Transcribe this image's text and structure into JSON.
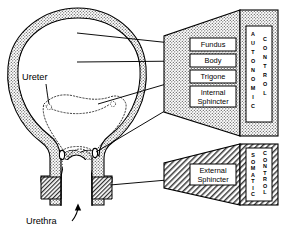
{
  "figure": {
    "organ_labels": [
      {
        "id": "ureter",
        "text": "Ureter"
      },
      {
        "id": "urethra",
        "text": "Urethra"
      }
    ],
    "autonomic_group": {
      "control_words": [
        "AUTONOMIC",
        "CONTROL"
      ],
      "parts": [
        {
          "id": "fundus",
          "lines": [
            "Fundus"
          ]
        },
        {
          "id": "body",
          "lines": [
            "Body"
          ]
        },
        {
          "id": "trigone",
          "lines": [
            "Trigone"
          ]
        },
        {
          "id": "internal-sphincter",
          "lines": [
            "Internal",
            "Sphincter"
          ]
        }
      ]
    },
    "somatic_group": {
      "control_words": [
        "SOMATIC",
        "CONTROL"
      ],
      "parts": [
        {
          "id": "external-sphincter",
          "lines": [
            "External",
            "Sphincter"
          ]
        }
      ]
    },
    "colors": {
      "ink": "#000000",
      "paper": "#ffffff",
      "stipple_fill": "#c9c9c9",
      "hatch_fill": "#b4b4b4",
      "wall_fill": "#d2d2d2"
    }
  }
}
